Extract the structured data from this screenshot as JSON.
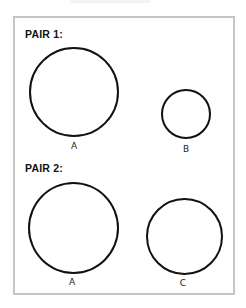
{
  "diagram": {
    "frame": {
      "border_color": "#c6c6c6",
      "background": "#ffffff"
    },
    "pairs": [
      {
        "title": "PAIR 1:",
        "circles": [
          {
            "label": "A",
            "cx": 74,
            "cy": 92,
            "r": 45
          },
          {
            "label": "B",
            "cx": 185,
            "cy": 114,
            "r": 25
          }
        ]
      },
      {
        "title": "PAIR 2:",
        "circles": [
          {
            "label": "A",
            "cx": 73,
            "cy": 228,
            "r": 45
          },
          {
            "label": "C",
            "cx": 184,
            "cy": 236,
            "r": 38
          }
        ]
      }
    ],
    "stroke_color": "#111111"
  }
}
